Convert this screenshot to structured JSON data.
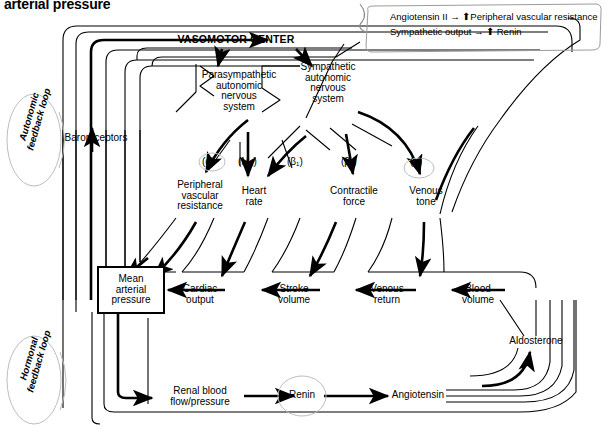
{
  "title": "arterial pressure",
  "legend": {
    "line1": "Angiotensin II → ⬆Peripheral vascular resistance",
    "line2": "Sympathetic output → ⬆ Renin"
  },
  "loops": {
    "autonomic": "Autonomic\nfeedback loop",
    "hormonal": "Hormonal\nfeedback loop"
  },
  "nodes": {
    "vasomotor_center": "VASOMOTOR CENTER",
    "baroreceptors": "Baroreceptors",
    "parasympathetic": "Parasympathetic\nautonomic\nnervous\nsystem",
    "sympathetic": "Sympathetic\nautonomic\nnervous\nsystem",
    "peripheral_vascular_resistance": "Peripheral\nvascular\nresistance",
    "heart_rate": "Heart\nrate",
    "contractile_force": "Contractile\nforce",
    "venous_tone": "Venous\ntone",
    "mean_arterial_pressure": "Mean\narterial\npressure",
    "cardiac_output": "Cardiac\noutput",
    "stroke_volume": "Stroke\nvolume",
    "venous_return": "Venous\nreturn",
    "blood_volume": "Blood\nvolume",
    "aldosterone": "Aldosterone",
    "renal_blood_flow": "Renal blood\nflow/pressure",
    "renin": "Renin",
    "angiotensin": "Angiotensin"
  },
  "receptors": {
    "alpha_pvr": "(α)",
    "m2_hr": "(M₂)",
    "beta1_hr": "(β₁)",
    "beta1_cf": "(β₁)",
    "alpha_vt": "(α)"
  },
  "colors": {
    "ink": "#000000",
    "paper": "#ffffff",
    "pencil": "#b9b9b9"
  }
}
